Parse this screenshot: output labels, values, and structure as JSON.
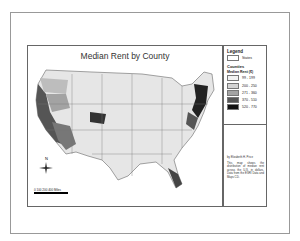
{
  "map": {
    "title": "Median Rent by County",
    "legend": {
      "heading": "Legend",
      "states_label": "States",
      "counties_label": "Counties",
      "field_label": "Median Rent ($)",
      "classes": [
        {
          "label": "99 - 199",
          "color": "#f2f2f2"
        },
        {
          "label": "200 - 250",
          "color": "#d4d4d4"
        },
        {
          "label": "271 - 360",
          "color": "#a3a3a3"
        },
        {
          "label": "370 - 510",
          "color": "#555555"
        },
        {
          "label": "520 - 770",
          "color": "#111111"
        }
      ]
    },
    "info": {
      "author": "by Elizabeth H. Price",
      "description": "This map shows the distribution of median rent across the U.S. in dollars. Data from the ESRI Data and Maps CD."
    },
    "compass": {
      "north_label": "N"
    },
    "scale": {
      "ticks": "0  100 200       400",
      "unit": "Miles"
    }
  }
}
